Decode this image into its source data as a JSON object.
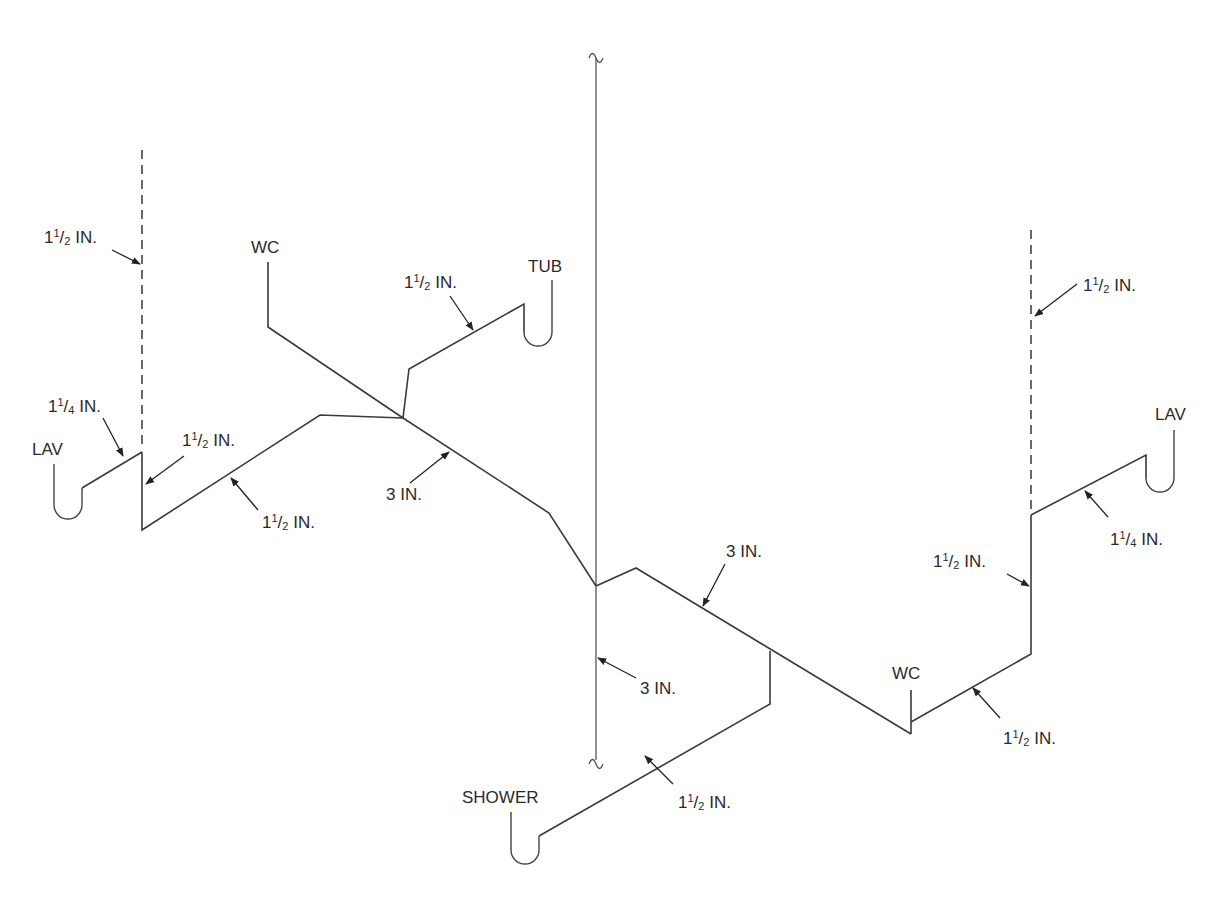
{
  "diagram": {
    "type": "isometric plumbing drainage / vent riser diagram",
    "stack": {
      "label_bottom": "3 IN.",
      "break_symbol": "~"
    },
    "fixtures": [
      {
        "id": "lav_left",
        "label": "LAV"
      },
      {
        "id": "wc_left",
        "label": "WC"
      },
      {
        "id": "tub",
        "label": "TUB"
      },
      {
        "id": "lav_right",
        "label": "LAV"
      },
      {
        "id": "wc_right",
        "label": "WC"
      },
      {
        "id": "shower",
        "label": "SHOWER"
      }
    ],
    "sizes": {
      "vent_left": {
        "whole": "1",
        "num": "1",
        "den": "2",
        "unit": "IN."
      },
      "lav_left_arm": {
        "whole": "1",
        "num": "1",
        "den": "4",
        "unit": "IN."
      },
      "riser_left": {
        "whole": "1",
        "num": "1",
        "den": "2",
        "unit": "IN."
      },
      "branch_left": {
        "whole": "1",
        "num": "1",
        "den": "2",
        "unit": "IN."
      },
      "tub_arm": {
        "whole": "1",
        "num": "1",
        "den": "2",
        "unit": "IN."
      },
      "main_upper": {
        "text": "3 IN."
      },
      "main_lower": {
        "text": "3 IN."
      },
      "stack_lower": {
        "text": "3 IN."
      },
      "vent_right": {
        "whole": "1",
        "num": "1",
        "den": "2",
        "unit": "IN."
      },
      "lav_right_arm": {
        "whole": "1",
        "num": "1",
        "den": "4",
        "unit": "IN."
      },
      "riser_right": {
        "whole": "1",
        "num": "1",
        "den": "2",
        "unit": "IN."
      },
      "wc_right_arm": {
        "whole": "1",
        "num": "1",
        "den": "2",
        "unit": "IN."
      },
      "shower_arm": {
        "whole": "1",
        "num": "1",
        "den": "2",
        "unit": "IN."
      }
    }
  }
}
